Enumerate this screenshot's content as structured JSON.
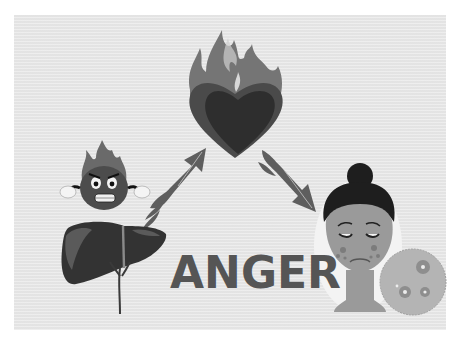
{
  "illustration": {
    "title": "ANGER",
    "colors": {
      "background": "#e8e8e8",
      "title_text": "#555555",
      "heart": "#3a3a3a",
      "flames": "#6e6e6e",
      "liver": "#2f2f2f",
      "skin": "#9a9a9a",
      "hair": "#1e1e1e"
    },
    "elements": [
      {
        "name": "burning-heart",
        "description": "heart engulfed in flames"
      },
      {
        "name": "angry-fireball-mascot",
        "description": "angry flame character with clenched fists"
      },
      {
        "name": "liver",
        "description": "liver organ with gallbladder and ducts"
      },
      {
        "name": "arrow-up-right",
        "description": "flaming arrow from liver to heart"
      },
      {
        "name": "arrow-down-right",
        "description": "flaming arrow from heart to face"
      },
      {
        "name": "sad-woman-face",
        "description": "woman with acne on cheeks"
      },
      {
        "name": "acne-magnifier",
        "description": "magnified circle of skin pimples"
      }
    ]
  }
}
